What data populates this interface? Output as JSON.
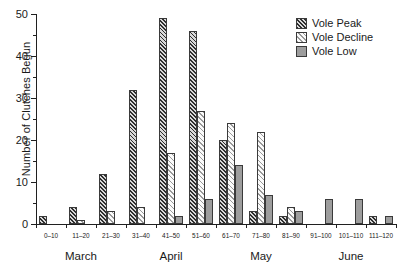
{
  "chart_data": {
    "type": "bar",
    "title": "",
    "xlabel": "",
    "ylabel": "Number of Clutches Begun",
    "ylim": [
      0,
      50
    ],
    "ytick_labels": [
      "0",
      "10",
      "20",
      "30",
      "40",
      "50"
    ],
    "ytick_values": [
      0,
      10,
      20,
      30,
      40,
      50
    ],
    "yminor_values": [
      5,
      15,
      25,
      35,
      45
    ],
    "grid": false,
    "legend_position": "top-right",
    "categories": [
      "0–10",
      "11–20",
      "21–30",
      "31–40",
      "41–50",
      "51–60",
      "61–70",
      "71–80",
      "81–90",
      "91–100",
      "101–110",
      "111–120"
    ],
    "group_labels": [
      {
        "label": "March",
        "span": [
          0,
          3
        ]
      },
      {
        "label": "April",
        "span": [
          3,
          6
        ]
      },
      {
        "label": "May",
        "span": [
          6,
          9
        ]
      },
      {
        "label": "June",
        "span": [
          9,
          12
        ]
      }
    ],
    "series": [
      {
        "name": "Vole Peak",
        "pattern": "dark-hatch",
        "color": "#2e2e2e",
        "values": [
          2,
          4,
          12,
          32,
          49,
          46,
          20,
          3,
          2,
          0,
          0,
          2
        ]
      },
      {
        "name": "Vole Decline",
        "pattern": "light-hatch",
        "color": "#9a9a9a",
        "values": [
          0,
          1,
          3,
          4,
          17,
          27,
          24,
          22,
          4,
          0,
          0,
          0
        ]
      },
      {
        "name": "Vole Low",
        "pattern": "solid-grey",
        "color": "#9d9d9d",
        "values": [
          0,
          0,
          0,
          0,
          2,
          6,
          14,
          7,
          3,
          6,
          6,
          2
        ]
      }
    ]
  },
  "legend": {
    "items": [
      {
        "label": "Vole Peak"
      },
      {
        "label": "Vole Decline"
      },
      {
        "label": "Vole Low"
      }
    ]
  }
}
